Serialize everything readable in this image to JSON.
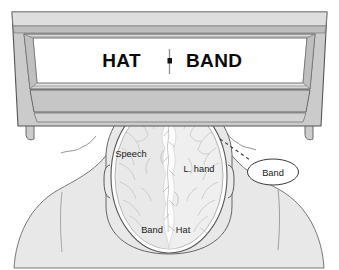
{
  "figure": {
    "background_color": "#ffffff"
  },
  "monitor": {
    "name": "stimulus-monitor",
    "frame_color": "#c9c9c9",
    "frame_shadow_color": "#b0b0b0",
    "outline_color": "#555555",
    "screen_color": "#ffffff",
    "screen": {
      "left_word": "HAT",
      "right_word": "BAND",
      "fixation": {
        "line_color": "#8a8a8a",
        "dot_color": "#111111"
      }
    }
  },
  "head": {
    "name": "head-top-view",
    "skin_color": "#e8e8e8",
    "outline_color": "#666666",
    "nose_label": "nose",
    "left_ear_label": "left-ear",
    "right_ear_label": "right-ear"
  },
  "brain": {
    "name": "brain-axial-view",
    "surface_color": "#eeeeee",
    "fissure_color": "#fbfbfb",
    "vessel_color": "#b9b9b9",
    "outline_color": "#5a5a5a",
    "labels": [
      {
        "id": "speech",
        "text": "Speech",
        "hemisphere": "left",
        "x": 131,
        "y": 157
      },
      {
        "id": "l-hand",
        "text": "L. hand",
        "hemisphere": "right",
        "x": 183,
        "y": 172
      },
      {
        "id": "band",
        "text": "Band",
        "hemisphere": "left",
        "x": 140,
        "y": 230
      },
      {
        "id": "hat",
        "text": "Hat",
        "hemisphere": "right",
        "x": 178,
        "y": 230
      }
    ]
  },
  "callout": {
    "name": "verbal-report-callout",
    "text": "Band",
    "bubble_fill": "#ffffff",
    "bubble_outline": "#3a3a3a",
    "leader_line_color": "#333333",
    "leader_line_style": "dashed"
  },
  "colors": {
    "ink": "#111111",
    "mid_gray": "#c9c9c9",
    "light_gray": "#e8e8e8",
    "pale_gray": "#eeeeee",
    "outline": "#5a5a5a"
  }
}
